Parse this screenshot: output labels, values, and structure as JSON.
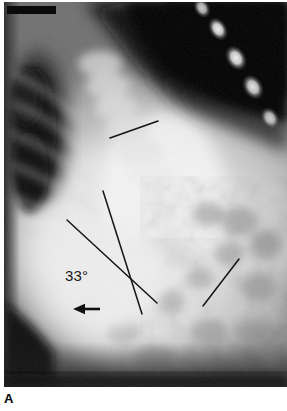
{
  "figure": {
    "panel_label": "A",
    "modality": "radiograph",
    "view": "lateral spine radiograph"
  },
  "annotations": {
    "angle_label": "33°",
    "arrow": {
      "name": "left-pointing-arrow",
      "direction": "left",
      "x1": 100,
      "y1": 309,
      "x2": 73,
      "y2": 309,
      "color": "#101010"
    },
    "marker_bar": {
      "name": "top-left-black-bar",
      "x": 7,
      "y": 6,
      "width": 49,
      "height": 8,
      "color": "#0a0a0a"
    },
    "measurement_lines": [
      {
        "name": "upper-endplate-reference-line",
        "x1": 110,
        "y1": 138,
        "x2": 158,
        "y2": 121,
        "color": "#141414",
        "width": 1.5
      },
      {
        "name": "cobb-line-superior",
        "x1": 103,
        "y1": 191,
        "x2": 142,
        "y2": 314,
        "color": "#141414",
        "width": 1.5
      },
      {
        "name": "cobb-line-inferior",
        "x1": 67,
        "y1": 220,
        "x2": 157,
        "y2": 303,
        "color": "#141414",
        "width": 1.5
      },
      {
        "name": "lower-vertebra-reference-line",
        "x1": 203,
        "y1": 306,
        "x2": 239,
        "y2": 259,
        "color": "#141414",
        "width": 1.5
      }
    ]
  },
  "colors": {
    "plate_background": "#6a6a6a",
    "page_background": "#ffffff",
    "annotation_ink": "#141414",
    "soft_tissue_bright": "#e8e8e8",
    "air_dark": "#080808"
  }
}
